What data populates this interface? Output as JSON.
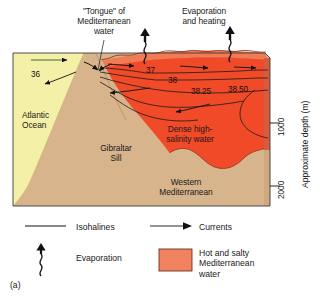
{
  "figure": {
    "panel_label": "(a)",
    "type": "block-diagram-cross-section"
  },
  "annotations": {
    "tongue": "\"Tongue\" of\nMediterranean\nwater",
    "evaporation_heating": "Evaporation\nand heating",
    "atlantic_ocean": "Atlantic\nOcean",
    "gibraltar_sill": "Gibraltar\nSill",
    "dense_high_salinity": "Dense high-\nsalinity water",
    "western_mediterranean": "Western\nMediterranean"
  },
  "isohalines": {
    "values": [
      "36",
      "37",
      "38",
      "38.25",
      "38.50"
    ]
  },
  "depth_axis": {
    "title": "Approximate depth (m)",
    "ticks": [
      "1000",
      "2000"
    ]
  },
  "legend": {
    "isohalines": "Isohalines",
    "currents": "Currents",
    "evaporation": "Evaporation",
    "hot_salty": "Hot and salty\nMediterranean\nwater"
  },
  "colors": {
    "mediterranean_water": "#F04A28",
    "atlantic_water": "#F5F0A8",
    "seafloor_tan": "#D8B48C",
    "surface_salmon": "#EF7C55",
    "legend_swatch": "#F0825F",
    "outline": "#2b2b2b"
  }
}
